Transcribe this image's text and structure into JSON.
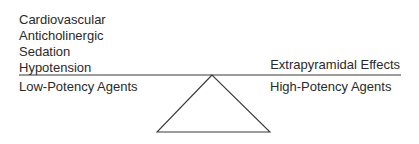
{
  "left_effects": [
    "Cardiovascular",
    "Anticholinergic",
    "Sedation",
    "Hypotension"
  ],
  "right_effect": "Extrapyramidal Effects",
  "left_label": "Low-Potency Agents",
  "right_label": "High-Potency Agents",
  "colors": {
    "line": "#3a3a3a",
    "text": "#2a2a2a"
  }
}
